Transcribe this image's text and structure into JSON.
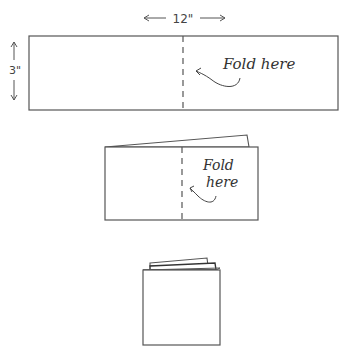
{
  "diagram": {
    "step1": {
      "width_label": "12\"",
      "height_label": "3\"",
      "annotation": "Fold here"
    },
    "step2": {
      "annotation_line1": "Fold",
      "annotation_line2": "here"
    },
    "step3": {}
  },
  "colors": {
    "line": "#555555",
    "text": "#333333"
  }
}
